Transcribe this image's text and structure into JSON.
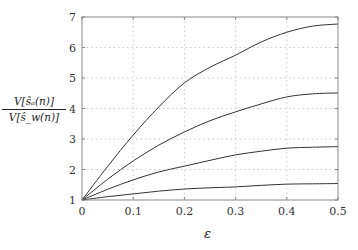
{
  "chart_data": {
    "type": "line",
    "title": "",
    "xlabel": "ε",
    "ylabel": "V[ŝ_a(n)] / V[ŝ_w(n)]",
    "ylabel_num": "V[ŝₐ(n)]",
    "ylabel_den": "V[ŝ_w(n)]",
    "xlim": [
      0,
      0.5
    ],
    "ylim": [
      1,
      7
    ],
    "xticks": [
      "0",
      "0.1",
      "0.2",
      "0.3",
      "0.4",
      "0.5"
    ],
    "yticks": [
      "1",
      "2",
      "3",
      "4",
      "5",
      "6",
      "7"
    ],
    "grid": true,
    "legend": null,
    "x": [
      0,
      0.05,
      0.1,
      0.15,
      0.2,
      0.25,
      0.3,
      0.35,
      0.4,
      0.45,
      0.5
    ],
    "series": [
      {
        "name": "curve-1",
        "values": [
          1.0,
          2.1,
          3.13,
          4.05,
          4.84,
          5.35,
          5.75,
          6.18,
          6.5,
          6.7,
          6.77
        ]
      },
      {
        "name": "curve-2",
        "values": [
          1.0,
          1.68,
          2.28,
          2.8,
          3.23,
          3.6,
          3.89,
          4.15,
          4.38,
          4.48,
          4.51
        ]
      },
      {
        "name": "curve-3",
        "values": [
          1.0,
          1.35,
          1.66,
          1.92,
          2.11,
          2.3,
          2.48,
          2.6,
          2.7,
          2.73,
          2.75
        ]
      },
      {
        "name": "curve-4",
        "values": [
          1.0,
          1.11,
          1.2,
          1.29,
          1.36,
          1.4,
          1.43,
          1.48,
          1.52,
          1.53,
          1.54
        ]
      }
    ]
  },
  "colors": {
    "line": "#333333",
    "axis": "#888888",
    "grid": "#cccccc"
  }
}
